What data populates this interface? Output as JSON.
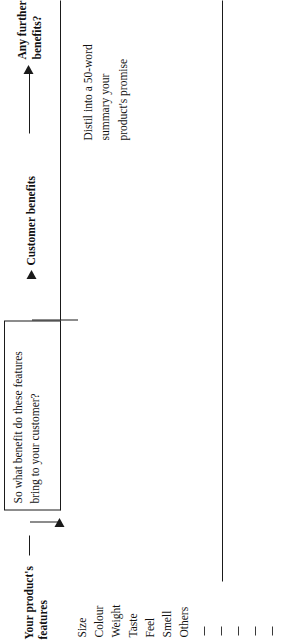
{
  "worksheet": {
    "start_label": "Your product's\nfeatures",
    "features_heading": "Your product's features",
    "features": [
      "Size",
      "Colour",
      "Weight",
      "Taste",
      "Feel",
      "Smell",
      "Others"
    ],
    "blank_rule_count": 5,
    "question_box": {
      "text": "So what benefit do these features\nbring to your customer?"
    },
    "stage_labels": {
      "customer_benefits": "Customer benefits",
      "any_further_benefits": "Any further\nbenefits?"
    },
    "annotation": {
      "text": "Distil into a 50-word\nsummary your\nproduct's promise"
    },
    "colors": {
      "ink": "#1a1a1a",
      "paper": "#ffffff",
      "rule": "#3a3a3a"
    }
  }
}
